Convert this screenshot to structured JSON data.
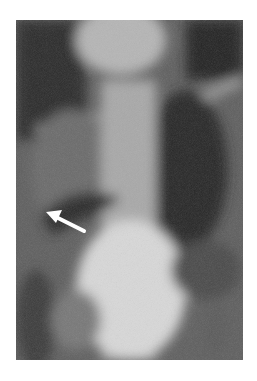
{
  "figure": {
    "type": "chest radiograph",
    "annotation": {
      "kind": "arrow",
      "color": "#ffffff"
    }
  }
}
